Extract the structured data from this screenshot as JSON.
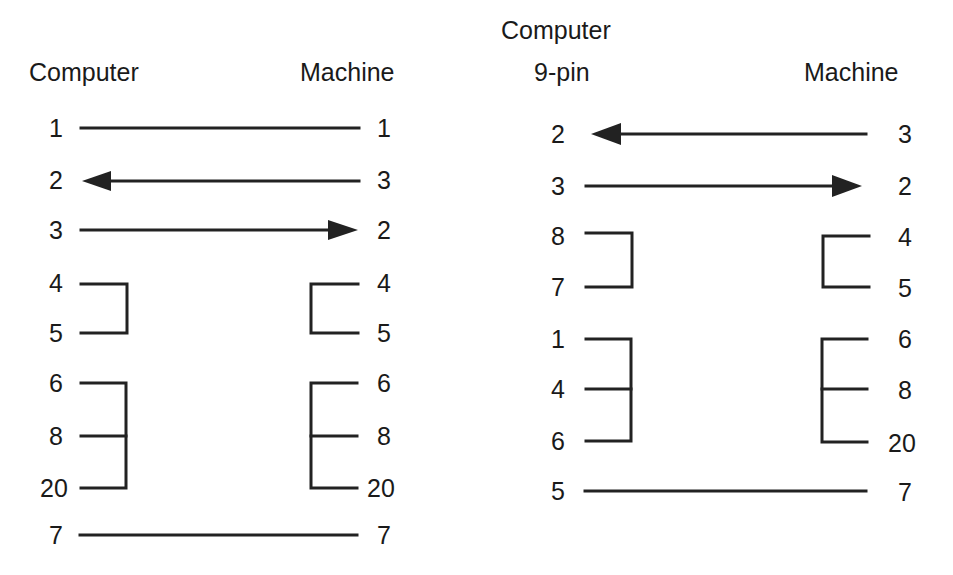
{
  "left_diagram": {
    "header_left": "Computer",
    "header_right": "Machine",
    "rows": [
      {
        "left": "1",
        "right": "1",
        "y": 128
      },
      {
        "left": "2",
        "right": "3",
        "y": 181
      },
      {
        "left": "3",
        "right": "2",
        "y": 230
      },
      {
        "left": "4",
        "right": "4",
        "y": 284
      },
      {
        "left": "5",
        "right": "5",
        "y": 333
      },
      {
        "left": "6",
        "right": "6",
        "y": 383
      },
      {
        "left": "8",
        "right": "8",
        "y": 436
      },
      {
        "left": "20",
        "right": "20",
        "y": 488
      },
      {
        "left": "7",
        "right": "7",
        "y": 535
      }
    ]
  },
  "right_diagram": {
    "header_left_line1": "Computer",
    "header_left_line2": "9-pin",
    "header_right": "Machine",
    "rows_left": [
      {
        "label": "2",
        "y": 134
      },
      {
        "label": "3",
        "y": 186
      },
      {
        "label": "8",
        "y": 236
      },
      {
        "label": "7",
        "y": 287
      },
      {
        "label": "1",
        "y": 339
      },
      {
        "label": "4",
        "y": 389
      },
      {
        "label": "6",
        "y": 441
      },
      {
        "label": "5",
        "y": 491
      }
    ],
    "rows_right": [
      {
        "label": "3",
        "y": 134
      },
      {
        "label": "2",
        "y": 186
      },
      {
        "label": "4",
        "y": 237
      },
      {
        "label": "5",
        "y": 288
      },
      {
        "label": "6",
        "y": 339
      },
      {
        "label": "8",
        "y": 390
      },
      {
        "label": "20",
        "y": 443
      },
      {
        "label": "7",
        "y": 492
      }
    ]
  },
  "colors": {
    "line": "#222222",
    "text": "#1a1a1a",
    "background": "#ffffff"
  }
}
